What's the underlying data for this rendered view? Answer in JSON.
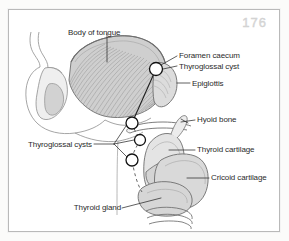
{
  "figure": {
    "page_number": "176",
    "border_color": "#b9b9b9",
    "background_color": "#ffffff",
    "ink_color": "#2b2b2b",
    "tongue_fill": "#d5d5d5",
    "cartilage_fill": "#e2e2e2",
    "gland_fill": "#d8d8d8"
  },
  "labels": {
    "body_of_tongue": "Body of tongue",
    "foramen_caecum": "Foramen caecum",
    "thyroglossal_cyst": "Thyroglossal cyst",
    "epiglottis": "Epiglottis",
    "hyoid_bone": "Hyoid bone",
    "thyroglossal_cysts": "Thyroglossal cysts",
    "thyroid_cartilage": "Thyroid cartilage",
    "cricoid_cartilage": "Cricoid cartilage",
    "thyroid_gland": "Thyroid gland"
  },
  "markers": {
    "cyst_count": 4,
    "cyst_positions": [
      {
        "name": "foramen-caecum-cyst",
        "x": 147,
        "y": 59
      },
      {
        "name": "suprahyoid-cyst",
        "x": 123,
        "y": 113
      },
      {
        "name": "hyoid-level-cyst",
        "x": 131,
        "y": 130
      },
      {
        "name": "infrahyoid-cyst",
        "x": 123,
        "y": 150
      }
    ]
  },
  "structures": [
    {
      "name": "body-of-tongue",
      "shaded": true
    },
    {
      "name": "mandible",
      "shaded": false
    },
    {
      "name": "epiglottis",
      "shaded": true
    },
    {
      "name": "hyoid-bone",
      "shaded": false
    },
    {
      "name": "thyroid-cartilage",
      "shaded": true
    },
    {
      "name": "cricoid-cartilage",
      "shaded": true
    },
    {
      "name": "thyroid-gland",
      "shaded": true
    },
    {
      "name": "trachea-rings",
      "shaded": false
    },
    {
      "name": "thyroglossal-duct-tract",
      "shaded": false
    }
  ]
}
